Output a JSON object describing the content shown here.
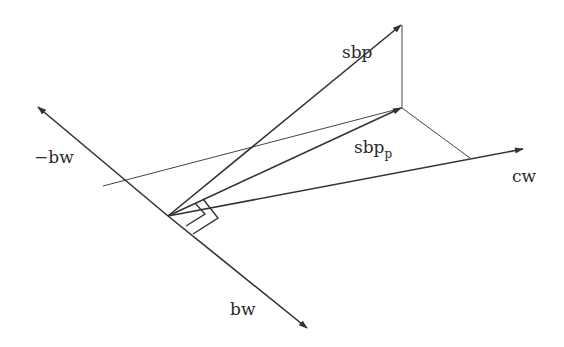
{
  "diagram": {
    "type": "vector-projection",
    "colors": {
      "stroke": "#333333",
      "background": "#ffffff"
    },
    "labels": {
      "sbp": "sbp",
      "sbp_p_base": "sbp",
      "sbp_p_sub": "p",
      "neg_bw": "−bw",
      "bw": "bw",
      "cw": "cw"
    },
    "vectors": [
      {
        "name": "sbp",
        "from": [
          168,
          216
        ],
        "to": [
          401,
          25
        ]
      },
      {
        "name": "sbp_p",
        "from": [
          168,
          216
        ],
        "to": [
          402,
          108
        ]
      },
      {
        "name": "cw",
        "from": [
          168,
          216
        ],
        "to": [
          523,
          149
        ]
      },
      {
        "name": "bw",
        "from": [
          168,
          216
        ],
        "to": [
          307,
          328
        ]
      },
      {
        "name": "neg_bw",
        "from": [
          168,
          216
        ],
        "to": [
          38,
          107
        ]
      }
    ],
    "projection_lines": [
      {
        "name": "sbp-to-plane",
        "from": [
          402,
          25
        ],
        "to": [
          402,
          108
        ]
      },
      {
        "name": "sbp_p-to-cw",
        "from": [
          402,
          108
        ],
        "to": [
          470,
          158
        ]
      },
      {
        "name": "neg_bw-to-sbp_p",
        "from": [
          103,
          186
        ],
        "to": [
          402,
          108
        ]
      }
    ]
  }
}
